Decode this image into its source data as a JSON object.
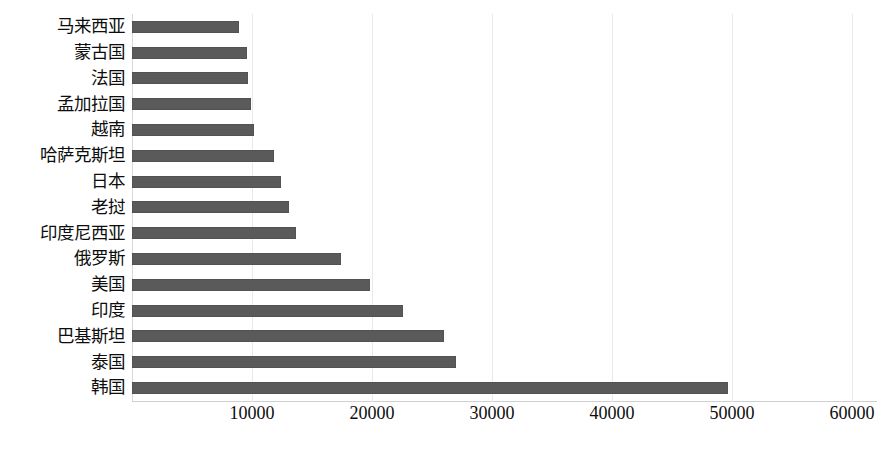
{
  "chart_data": {
    "type": "bar",
    "orientation": "horizontal",
    "title": "",
    "subtitle": "",
    "xlabel": "",
    "ylabel": "",
    "xlim": [
      0,
      62000
    ],
    "grid": true,
    "legend": null,
    "bar_color": "#5a5a5a",
    "categories": [
      "马来西亚",
      "蒙古国",
      "法国",
      "孟加拉国",
      "越南",
      "哈萨克斯坦",
      "日本",
      "老挝",
      "印度尼西亚",
      "俄罗斯",
      "美国",
      "印度",
      "巴基斯坦",
      "泰国",
      "韩国"
    ],
    "values": [
      8950,
      9550,
      9650,
      9950,
      10200,
      11800,
      12450,
      13100,
      13650,
      17400,
      19800,
      22600,
      26000,
      27000,
      49700
    ],
    "xticks": [
      10000,
      20000,
      30000,
      40000,
      50000,
      60000
    ],
    "xtick_labels": [
      "10000",
      "20000",
      "30000",
      "40000",
      "50000",
      "60000"
    ]
  }
}
